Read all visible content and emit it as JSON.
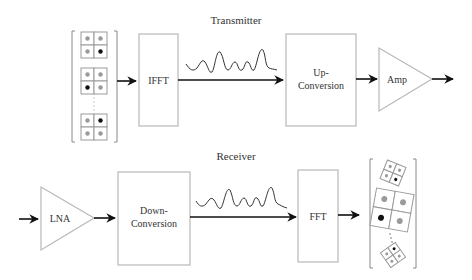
{
  "transmitter": {
    "title": "Transmitter",
    "blocks": {
      "ifft": "IFFT",
      "upconv_line1": "Up-",
      "upconv_line2": "Conversion",
      "amp": "Amp"
    }
  },
  "receiver": {
    "title": "Receiver",
    "blocks": {
      "lna": "LNA",
      "downconv_line1": "Down-",
      "downconv_line2": "Conversion",
      "fft": "FFT"
    }
  },
  "colors": {
    "block_stroke": "#b8b8b8",
    "arrow": "#111111",
    "dot_gray": "#9a9a9a",
    "dot_black": "#111111"
  }
}
